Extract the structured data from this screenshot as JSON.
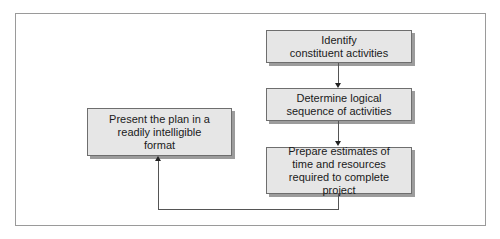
{
  "diagram": {
    "type": "flowchart",
    "nodes": [
      {
        "id": "identify",
        "label": "Identify\nconstituent activities"
      },
      {
        "id": "sequence",
        "label": "Determine logical\nsequence of activities"
      },
      {
        "id": "estimate",
        "label": "Prepare estimates of\ntime and resources\nrequired to complete project"
      },
      {
        "id": "present",
        "label": "Present the plan in a\nreadily intelligible\nformat"
      }
    ],
    "edges": [
      {
        "from": "identify",
        "to": "sequence"
      },
      {
        "from": "sequence",
        "to": "estimate"
      },
      {
        "from": "estimate",
        "to": "present"
      }
    ],
    "colors": {
      "box_fill": "#e6e6e6",
      "box_border": "#6e6e6e",
      "shadow": "#9c9c9c",
      "line": "#555555",
      "frame": "#9a9a9a"
    }
  },
  "caption": ""
}
